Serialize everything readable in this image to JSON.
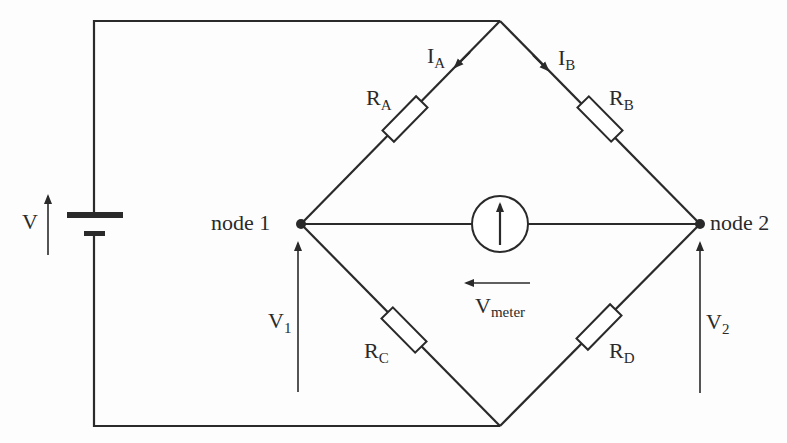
{
  "diagram": {
    "type": "circuit",
    "source": {
      "label": "V",
      "symbol": "battery-icon"
    },
    "nodes": [
      {
        "id": "node1",
        "label": "node 1"
      },
      {
        "id": "node2",
        "label": "node 2"
      }
    ],
    "resistors": [
      {
        "id": "RA",
        "main": "R",
        "sub": "A"
      },
      {
        "id": "RB",
        "main": "R",
        "sub": "B"
      },
      {
        "id": "RC",
        "main": "R",
        "sub": "C"
      },
      {
        "id": "RD",
        "main": "R",
        "sub": "D"
      }
    ],
    "currents": [
      {
        "id": "IA",
        "main": "I",
        "sub": "A"
      },
      {
        "id": "IB",
        "main": "I",
        "sub": "B"
      }
    ],
    "voltages": [
      {
        "id": "V1",
        "main": "V",
        "sub": "1"
      },
      {
        "id": "V2",
        "main": "V",
        "sub": "2"
      },
      {
        "id": "Vmeter",
        "main": "V",
        "sub": "meter"
      }
    ],
    "meter": {
      "symbol": "voltmeter-icon"
    },
    "colors": {
      "ink": "#2a2a2a",
      "background": "#fdfdfd"
    }
  }
}
